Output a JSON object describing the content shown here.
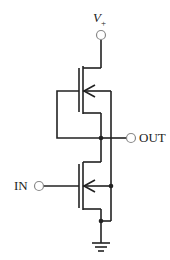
{
  "diagram": {
    "type": "CMOS inverter circuit",
    "labels": {
      "supply": "V",
      "supply_sub": "+",
      "input": "IN",
      "output": "OUT"
    },
    "components": [
      {
        "name": "PMOS transistor",
        "position": "top"
      },
      {
        "name": "NMOS transistor",
        "position": "bottom"
      },
      {
        "name": "ground",
        "position": "bottom"
      }
    ],
    "colors": {
      "line": "#222222",
      "terminal": "#888888"
    }
  }
}
